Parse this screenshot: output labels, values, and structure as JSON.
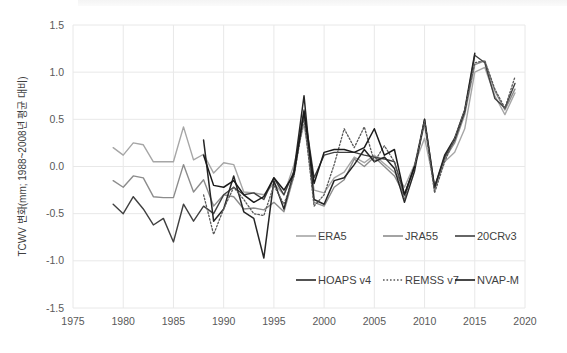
{
  "chart_data": {
    "type": "line",
    "title": "",
    "xlabel": "",
    "ylabel": "TCWV 변화(mm; 1988~2008년 평균 대비)",
    "xlim": [
      1975,
      2020
    ],
    "ylim": [
      -1.5,
      1.5
    ],
    "xticks": [
      "1975",
      "1980",
      "1985",
      "1990",
      "1995",
      "2000",
      "2005",
      "2010",
      "2015",
      "2020"
    ],
    "yticks": [
      "1.5",
      "1.0",
      "0.5",
      "0.0",
      "-0.5",
      "-1.0",
      "-1.5"
    ],
    "grid": true,
    "legend_position": "inside-bottom-right",
    "x": [
      1979,
      1980,
      1981,
      1982,
      1983,
      1984,
      1985,
      1986,
      1987,
      1988,
      1989,
      1990,
      1991,
      1992,
      1993,
      1994,
      1995,
      1996,
      1997,
      1998,
      1999,
      2000,
      2001,
      2002,
      2003,
      2004,
      2005,
      2006,
      2007,
      2008,
      2009,
      2010,
      2011,
      2012,
      2013,
      2014,
      2015,
      2016,
      2017,
      2018,
      2019
    ],
    "series": [
      {
        "name": "ERA5",
        "color": "#a6a6a6",
        "style": "solid",
        "width": 1.4,
        "x": [
          1979,
          1980,
          1981,
          1982,
          1983,
          1984,
          1985,
          1986,
          1987,
          1988,
          1989,
          1990,
          1991,
          1992,
          1993,
          1994,
          1995,
          1996,
          1997,
          1998,
          1999,
          2000,
          2001,
          2002,
          2003,
          2004,
          2005,
          2006,
          2007,
          2008,
          2009,
          2010,
          2011,
          2012,
          2013,
          2014,
          2015,
          2016,
          2017,
          2018,
          2019
        ],
        "values": [
          0.2,
          0.12,
          0.25,
          0.23,
          0.05,
          0.05,
          0.05,
          0.42,
          0.07,
          0.13,
          -0.07,
          0.04,
          0.02,
          -0.27,
          -0.28,
          -0.3,
          -0.18,
          -0.3,
          0.02,
          0.45,
          -0.25,
          -0.28,
          -0.12,
          -0.06,
          0.1,
          0.04,
          0.12,
          0.03,
          -0.06,
          -0.22,
          0.02,
          0.3,
          -0.2,
          0.05,
          0.15,
          0.4,
          1.0,
          1.05,
          0.75,
          0.55,
          0.78
        ]
      },
      {
        "name": "JRA55",
        "color": "#8c8c8c",
        "style": "solid",
        "width": 1.4,
        "x": [
          1979,
          1980,
          1981,
          1982,
          1983,
          1984,
          1985,
          1986,
          1987,
          1988,
          1989,
          1990,
          1991,
          1992,
          1993,
          1994,
          1995,
          1996,
          1997,
          1998,
          1999,
          2000,
          2001,
          2002,
          2003,
          2004,
          2005,
          2006,
          2007,
          2008,
          2009,
          2010,
          2011,
          2012,
          2013,
          2014,
          2015,
          2016,
          2017,
          2018,
          2019
        ],
        "values": [
          -0.15,
          -0.22,
          -0.1,
          -0.12,
          -0.32,
          -0.33,
          -0.33,
          0.02,
          -0.27,
          -0.14,
          -0.42,
          -0.3,
          -0.32,
          -0.45,
          -0.44,
          -0.46,
          -0.38,
          -0.48,
          -0.1,
          0.55,
          -0.38,
          -0.42,
          -0.22,
          -0.14,
          0.08,
          0.0,
          0.1,
          0.0,
          -0.1,
          -0.3,
          0.0,
          0.45,
          -0.25,
          0.08,
          0.25,
          0.55,
          1.08,
          1.12,
          0.8,
          0.6,
          0.82
        ]
      },
      {
        "name": "20CRv3",
        "color": "#404040",
        "style": "solid",
        "width": 1.4,
        "x": [
          1979,
          1980,
          1981,
          1982,
          1983,
          1984,
          1985,
          1986,
          1987,
          1988,
          1989,
          1990,
          1991,
          1992,
          1993,
          1994,
          1995,
          1996,
          1997,
          1998,
          1999,
          2000,
          2001,
          2002,
          2003,
          2004,
          2005,
          2006,
          2007,
          2008,
          2009,
          2010,
          2011,
          2012,
          2013,
          2014,
          2015,
          2016,
          2017,
          2018,
          2019
        ],
        "values": [
          -0.4,
          -0.5,
          -0.32,
          -0.45,
          -0.62,
          -0.55,
          -0.8,
          -0.4,
          -0.58,
          -0.42,
          -0.5,
          -0.3,
          -0.22,
          -0.3,
          -0.28,
          -0.35,
          -0.12,
          -0.3,
          -0.05,
          0.6,
          -0.12,
          0.12,
          0.15,
          0.15,
          0.15,
          0.12,
          0.1,
          0.08,
          0.05,
          -0.3,
          0.0,
          0.5,
          -0.22,
          0.1,
          0.28,
          0.58,
          1.18,
          1.1,
          0.72,
          0.62,
          0.88
        ]
      },
      {
        "name": "HOAPS v4",
        "color": "#262626",
        "style": "solid",
        "width": 1.5,
        "x": [
          1988,
          1989,
          1990,
          1991,
          1992,
          1993,
          1994,
          1995,
          1996,
          1997,
          1998,
          1999,
          2000,
          2001,
          2002,
          2003,
          2004,
          2005,
          2006,
          2007,
          2008,
          2009,
          2010,
          2011,
          2012,
          2013,
          2014,
          2015
        ],
        "values": [
          0.28,
          -0.58,
          -0.45,
          -0.1,
          -0.48,
          -0.55,
          -0.97,
          -0.15,
          -0.45,
          -0.05,
          0.75,
          -0.35,
          -0.4,
          -0.15,
          -0.12,
          0.02,
          0.18,
          0.05,
          0.1,
          -0.02,
          -0.38,
          -0.05,
          0.5,
          -0.22,
          0.12,
          0.3,
          0.6,
          1.2
        ]
      },
      {
        "name": "REMSS v7",
        "color": "#595959",
        "style": "dotted",
        "width": 1.3,
        "x": [
          1988,
          1989,
          1990,
          1991,
          1992,
          1993,
          1994,
          1995,
          1996,
          1997,
          1998,
          1999,
          2000,
          2001,
          2002,
          2003,
          2004,
          2005,
          2006,
          2007,
          2008,
          2009,
          2010,
          2011,
          2012,
          2013,
          2014,
          2015,
          2016,
          2017,
          2018,
          2019
        ],
        "values": [
          -0.3,
          -0.72,
          -0.45,
          -0.22,
          -0.35,
          -0.5,
          -0.52,
          -0.2,
          -0.4,
          -0.1,
          0.52,
          -0.42,
          -0.3,
          0.02,
          0.4,
          0.2,
          0.42,
          0.05,
          0.22,
          0.05,
          -0.35,
          0.0,
          0.48,
          -0.28,
          0.05,
          0.3,
          0.6,
          1.1,
          1.12,
          0.82,
          0.62,
          0.95
        ]
      },
      {
        "name": "NVAP-M",
        "color": "#1a1a1a",
        "style": "solid",
        "width": 1.5,
        "x": [
          1988,
          1989,
          1990,
          1991,
          1992,
          1993,
          1994,
          1995,
          1996,
          1997,
          1998,
          1999,
          2000,
          2001,
          2002,
          2003,
          2004,
          2005,
          2006,
          2007,
          2008,
          2009
        ],
        "values": [
          0.12,
          -0.2,
          -0.22,
          -0.15,
          -0.3,
          -0.38,
          -0.32,
          -0.12,
          -0.25,
          -0.08,
          0.58,
          -0.18,
          0.15,
          0.18,
          0.18,
          0.15,
          0.2,
          0.4,
          0.12,
          0.18,
          -0.3,
          0.0
        ]
      }
    ],
    "legend": [
      {
        "label": "ERA5",
        "color": "#a6a6a6",
        "style": "solid"
      },
      {
        "label": "JRA55",
        "color": "#8c8c8c",
        "style": "solid"
      },
      {
        "label": "20CRv3",
        "color": "#404040",
        "style": "solid"
      },
      {
        "label": "HOAPS v4",
        "color": "#262626",
        "style": "solid"
      },
      {
        "label": "REMSS v7",
        "color": "#595959",
        "style": "dotted"
      },
      {
        "label": "NVAP-M",
        "color": "#1a1a1a",
        "style": "solid"
      }
    ]
  },
  "colors": {
    "grid": "#e8e8e8",
    "tick_text": "#595959",
    "axis_label": "#404040",
    "background": "#ffffff"
  }
}
